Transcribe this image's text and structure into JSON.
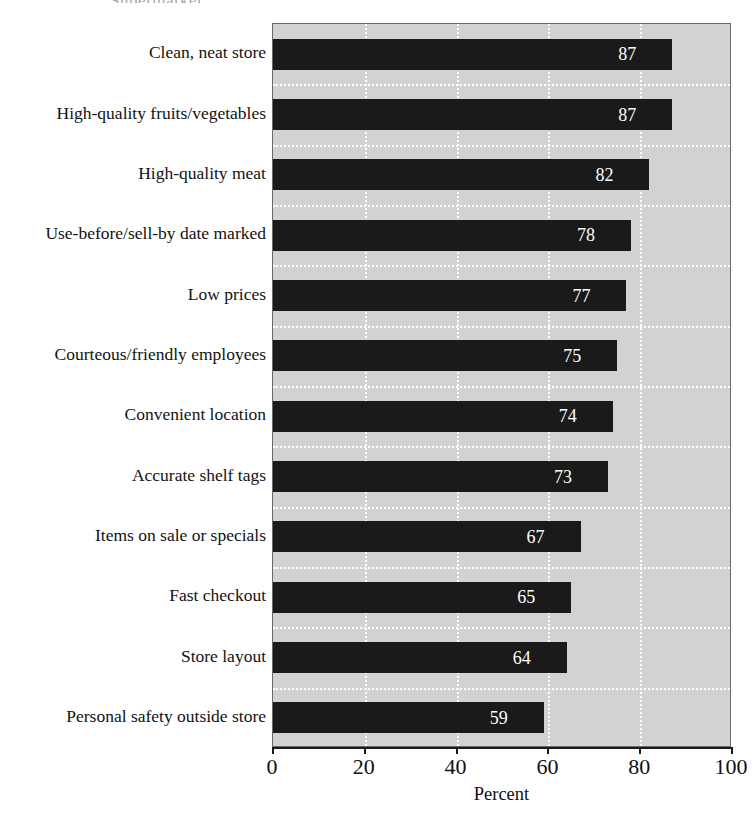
{
  "figure": {
    "title_remnant": "Supermarket",
    "background_color": "#ffffff",
    "plot_background_color": "#d2d2d2",
    "bar_color": "#1a1a1a",
    "gridline_color": "#ffffff",
    "value_label_color": "#ffffff"
  },
  "chart_data": {
    "type": "bar",
    "orientation": "horizontal",
    "title": "",
    "xlabel": "Percent",
    "ylabel": "",
    "xlim": [
      0,
      100
    ],
    "xticks": [
      0,
      20,
      40,
      60,
      80,
      100
    ],
    "xtick_labels": [
      "0",
      "20",
      "40",
      "60",
      "80",
      "100"
    ],
    "grid": true,
    "grid_style": "white dotted, vertical at ticks and horizontal between bars",
    "legend": "none",
    "categories": [
      "Clean, neat store",
      "High-quality fruits/vegetables",
      "High-quality meat",
      "Use-before/sell-by date marked",
      "Low prices",
      "Courteous/friendly employees",
      "Convenient location",
      "Accurate shelf tags",
      "Items on sale or specials",
      "Fast checkout",
      "Store layout",
      "Personal safety outside store"
    ],
    "values": [
      87,
      87,
      82,
      78,
      77,
      75,
      74,
      73,
      67,
      65,
      64,
      59
    ],
    "value_labels": [
      "87",
      "87",
      "82",
      "78",
      "77",
      "75",
      "74",
      "73",
      "67",
      "65",
      "64",
      "59"
    ]
  }
}
